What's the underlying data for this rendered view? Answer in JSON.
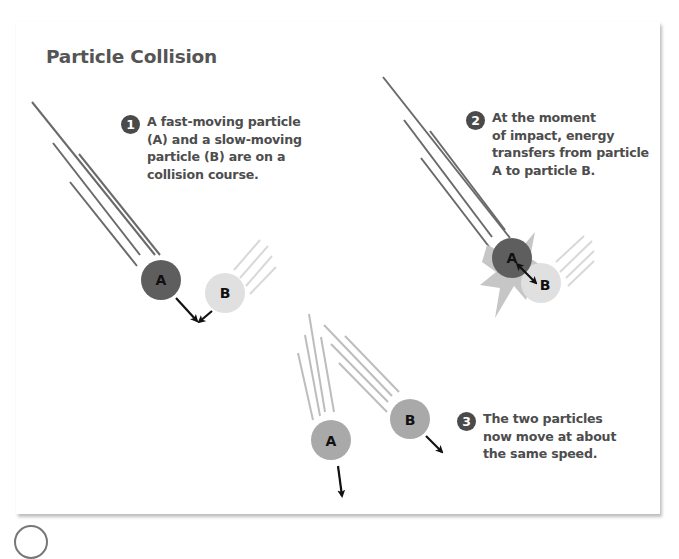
{
  "title": "Particle Collision",
  "steps": [
    {
      "number": "1",
      "text": "A fast-moving particle (A) and a slow-moving particle (B) are on a collision course.",
      "lines": [
        "A fast-moving particle",
        "(A) and a slow-moving",
        "particle (B) are on a",
        "collision course."
      ]
    },
    {
      "number": "2",
      "text": "At the moment of impact, energy transfers from particle A to particle B.",
      "lines": [
        "At the moment",
        "of impact, energy",
        "transfers from particle",
        "A to particle B."
      ]
    },
    {
      "number": "3",
      "text": "The two particles now move at about the same speed.",
      "lines": [
        "The two particles",
        "now move at about",
        "the same speed."
      ]
    }
  ],
  "particles": {
    "panel1": {
      "a_label": "A",
      "b_label": "B"
    },
    "panel2": {
      "a_label": "A",
      "b_label": "B"
    },
    "panel3": {
      "a_label": "A",
      "b_label": "B"
    }
  },
  "colors": {
    "particle_a_fast": "#5e5e5e",
    "particle_b_slow": "#e0e0e0",
    "particle_after": "#a9a9a9",
    "motion_lines_dark": "#6a6a6a",
    "motion_lines_light": "#d6d6d6",
    "badge": "#4a4a4a",
    "text": "#4d4d4d"
  }
}
